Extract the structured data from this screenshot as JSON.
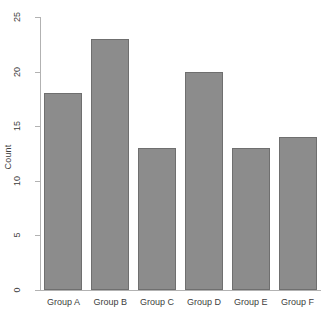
{
  "chart_data": {
    "type": "bar",
    "title": "",
    "subtitle": "",
    "xlabel": "",
    "ylabel": "Count",
    "categories": [
      "Group A",
      "Group B",
      "Group C",
      "Group D",
      "Group E",
      "Group F"
    ],
    "values": [
      18,
      23,
      13,
      20,
      13,
      14
    ],
    "ylim": [
      0,
      25
    ],
    "yticks": [
      0,
      5,
      10,
      15,
      20,
      25
    ],
    "ytick_labels": [
      "0",
      "5",
      "10",
      "15",
      "20",
      "25"
    ],
    "grid": false,
    "legend": null,
    "legend_position": "none",
    "annotations": [],
    "colors": {
      "bar_fill": "#8c8c8c",
      "bar_border": "#6f6f6f",
      "axis": "#b2b2b2",
      "text": "#3d3d3d",
      "background": "#ffffff"
    },
    "tick_label_rotation": 90
  }
}
